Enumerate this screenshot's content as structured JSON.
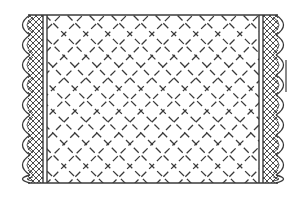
{
  "illustration": {
    "subject": "quilted-blanket-line-drawing",
    "colors": {
      "background": "#ffffff",
      "ink": "#3a3a3a"
    },
    "body": {
      "left": 47,
      "right": 259,
      "top": 15,
      "bottom": 183,
      "pattern": "dashed-diagonal-lattice",
      "lattice_spacing": 22
    },
    "left_border": {
      "outer_scallop_x": 21,
      "band_left": 30,
      "band_right": 42,
      "line1_x": 43,
      "line2_x": 47
    },
    "right_border": {
      "line1_x": 259,
      "line2_x": 263,
      "band_left": 264,
      "band_right": 276,
      "outer_scallop_x": 285
    },
    "scallop_period": 20
  }
}
